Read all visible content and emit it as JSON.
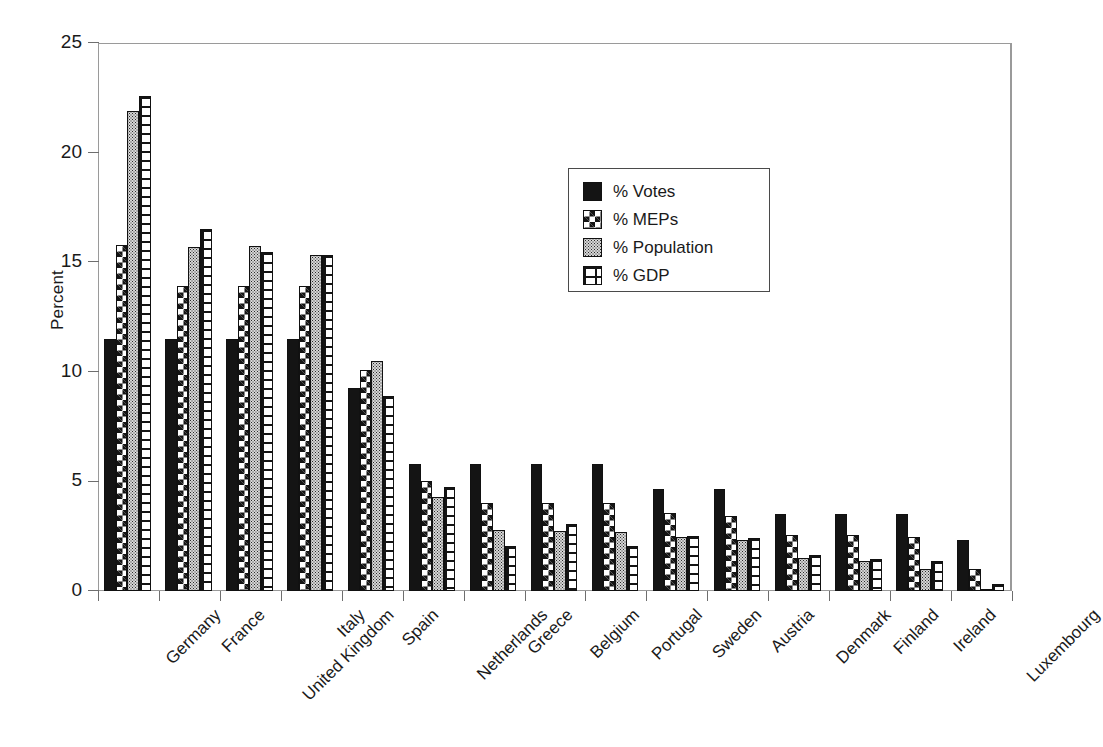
{
  "chart_data": {
    "type": "bar",
    "title": "",
    "xlabel": "",
    "ylabel": "Percent",
    "ylim": [
      0,
      25
    ],
    "yticks": [
      0,
      5,
      10,
      15,
      20,
      25
    ],
    "grid": false,
    "legend_position": "upper-center",
    "categories": [
      "Germany",
      "France",
      "United Kingdom",
      "Italy",
      "Spain",
      "Netherlands",
      "Greece",
      "Belgium",
      "Portugal",
      "Sweden",
      "Austria",
      "Denmark",
      "Finland",
      "Ireland",
      "Luxembourg"
    ],
    "series": [
      {
        "name": "% Votes",
        "pattern": "solid-black",
        "values": [
          11.5,
          11.5,
          11.5,
          11.5,
          9.25,
          5.8,
          5.8,
          5.8,
          5.8,
          4.65,
          4.65,
          3.5,
          3.5,
          3.5,
          2.35
        ]
      },
      {
        "name": "% MEPs",
        "pattern": "diamond-checker",
        "values": [
          15.8,
          13.9,
          13.9,
          13.9,
          10.1,
          5.0,
          4.0,
          4.0,
          4.0,
          3.55,
          3.4,
          2.55,
          2.55,
          2.45,
          1.0
        ]
      },
      {
        "name": "% Population",
        "pattern": "fine-dots",
        "values": [
          21.9,
          15.7,
          15.75,
          15.35,
          10.5,
          4.3,
          2.8,
          2.75,
          2.7,
          2.45,
          2.35,
          1.5,
          1.35,
          1.0,
          0.1
        ]
      },
      {
        "name": "% GDP",
        "pattern": "brick-grid",
        "values": [
          22.6,
          16.5,
          15.45,
          15.35,
          8.9,
          4.75,
          2.05,
          3.05,
          2.05,
          2.5,
          2.4,
          1.65,
          1.45,
          1.35,
          0.3
        ]
      }
    ]
  },
  "axis": {
    "y_title": "Percent",
    "y_tick_labels": [
      "0",
      "5",
      "10",
      "15",
      "20",
      "25"
    ]
  },
  "legend": {
    "items": [
      {
        "label": "% Votes"
      },
      {
        "label": "% MEPs"
      },
      {
        "label": "% Population"
      },
      {
        "label": "% GDP"
      }
    ]
  },
  "colors": {
    "series_votes": "#141414",
    "series_meps": "#141414",
    "series_population": "#d6d6d6",
    "series_gdp": "#141414",
    "frame": "#9a9a9a",
    "text": "#1a1a1a"
  }
}
